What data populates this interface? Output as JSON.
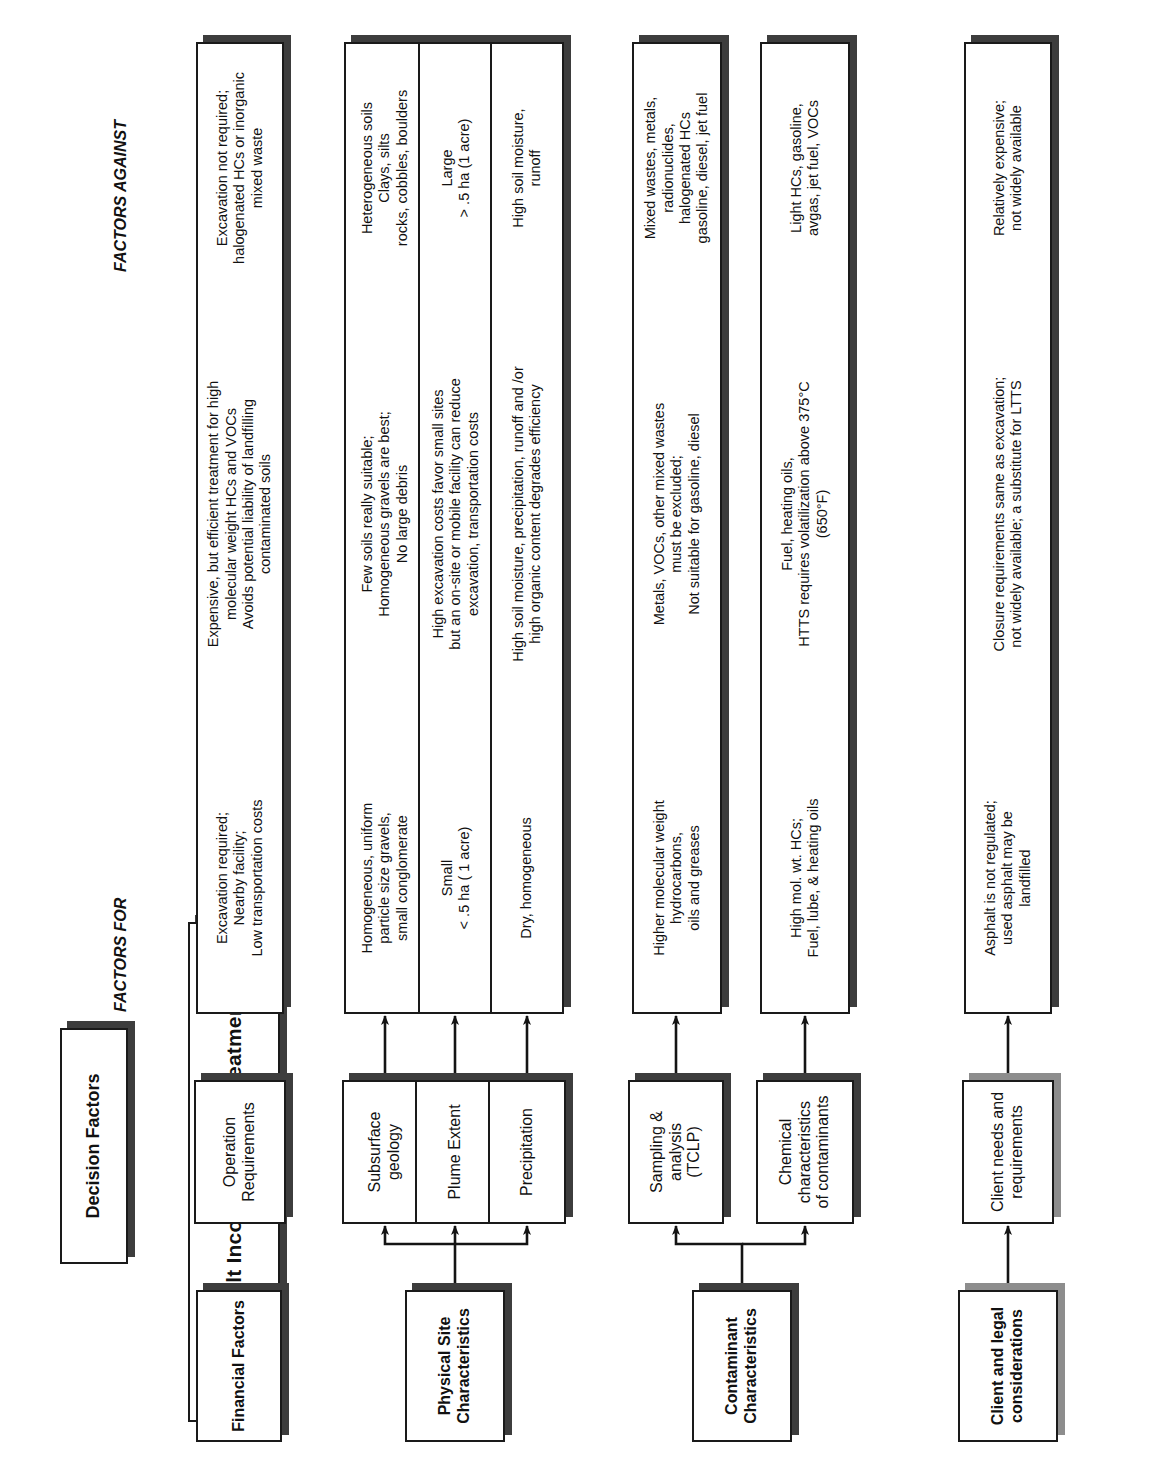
{
  "diagram": {
    "title": "Asphalt Incorporation & Treatment",
    "headers": {
      "evaluation_parameters": "Evaluation Parameters",
      "decision_factors": "Decision Factors",
      "factors_for": "FACTORS FOR",
      "factors_against": "FACTORS AGAINST"
    },
    "categories": [
      {
        "id": "financial",
        "label": "Financial Factors"
      },
      {
        "id": "physical",
        "label": "Physical Site\nCharacteristics"
      },
      {
        "id": "contaminant",
        "label": "Contaminant\nCharacteristics"
      },
      {
        "id": "client",
        "label": "Client and legal\nconsiderations"
      }
    ],
    "rows": [
      {
        "id": "operation-requirements",
        "category": "financial",
        "node": "Operation\nRequirements",
        "factors_for": "Excavation required;\nNearby facility;\nLow transportation costs",
        "evaluation": "Expensive, but efficient treatment for high\nmolecular weight HCs and VOCs\nAvoids potential liability of landfilling\ncontaminated soils",
        "factors_against": "Excavation not required;\nhalogenated HCs or inorganic\nmixed waste"
      },
      {
        "id": "subsurface-geology",
        "category": "physical",
        "node": "Subsurface\ngeology",
        "factors_for": "Homogeneous, uniform\nparticle size gravels,\nsmall conglomerate",
        "evaluation": "Few soils really suitable;\nHomogeneous gravels are best;\nNo large debris",
        "factors_against": "Heterogeneous soils\nClays, silts\nrocks, cobbles, boulders"
      },
      {
        "id": "plume-extent",
        "category": "physical",
        "node": "Plume Extent",
        "factors_for": "Small\n< .5 ha ( 1 acre)",
        "evaluation": "High excavation costs favor small sites\nbut an on-site or mobile facility can reduce\nexcavation, transportation costs",
        "factors_against": "Large\n> .5 ha (1 acre)"
      },
      {
        "id": "precipitation",
        "category": "physical",
        "node": "Precipitation",
        "factors_for": "Dry, homogeneous",
        "evaluation": "High soil moisture, precipitation, runoff and /or\nhigh organic content degrades efficiency",
        "factors_against": "High soil moisture,\nrunoff"
      },
      {
        "id": "sampling-analysis",
        "category": "contaminant",
        "node": "Sampling &\nanalysis\n(TCLP)",
        "factors_for": "Higher molecular weight\nhydrocarbons,\noils and greases",
        "evaluation": "Metals, VOCs, other mixed wastes\nmust be excluded;\nNot suitable for gasoline, diesel",
        "factors_against": "Mixed wastes, metals,\nradionuclides,\nhalogenated HCs\ngasoline, diesel, jet fuel"
      },
      {
        "id": "chemical-characteristics",
        "category": "contaminant",
        "node": "Chemical\ncharacteristics\nof contaminants",
        "factors_for": "High mol. wt. HCs;\nFuel, lube, & heating oils",
        "evaluation": "Fuel, heating oils,\nHTTS requires volatilization above 375°C\n(650°F)",
        "factors_against": "Light HCs, gasoline,\navgas, jet fuel, VOCs"
      },
      {
        "id": "client-needs",
        "category": "client",
        "node": "Client needs and\nrequirements",
        "factors_for": "Asphalt is not regulated;\nused asphalt may be\nlandfilled",
        "evaluation": "Closure requirements same as excavation;\nnot widely available; a substitute for LTTS",
        "factors_against": "Relatively expensive;\nnot widely available"
      }
    ],
    "colors": {
      "ink": "#111111",
      "shadow_dark": "#3d3d3d",
      "shadow_grey": "#8d8d8d",
      "background": "#ffffff"
    }
  }
}
